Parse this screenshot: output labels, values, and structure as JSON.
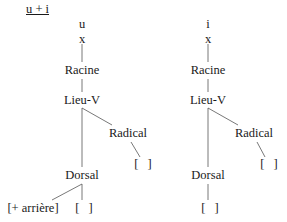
{
  "title": "u + i",
  "trees": [
    {
      "segment": "u",
      "timing": "x",
      "root": "Racine",
      "place": "Lieu-V",
      "radical": "Radical",
      "radical_value": "[   ]",
      "dorsal": "Dorsal",
      "dorsal_feature": "[+ arrière]",
      "dorsal_empty": "[   ]"
    },
    {
      "segment": "i",
      "timing": "x",
      "root": "Racine",
      "place": "Lieu-V",
      "radical": "Radical",
      "radical_value": "[   ]",
      "dorsal": "Dorsal",
      "dorsal_empty": "[   ]"
    }
  ]
}
